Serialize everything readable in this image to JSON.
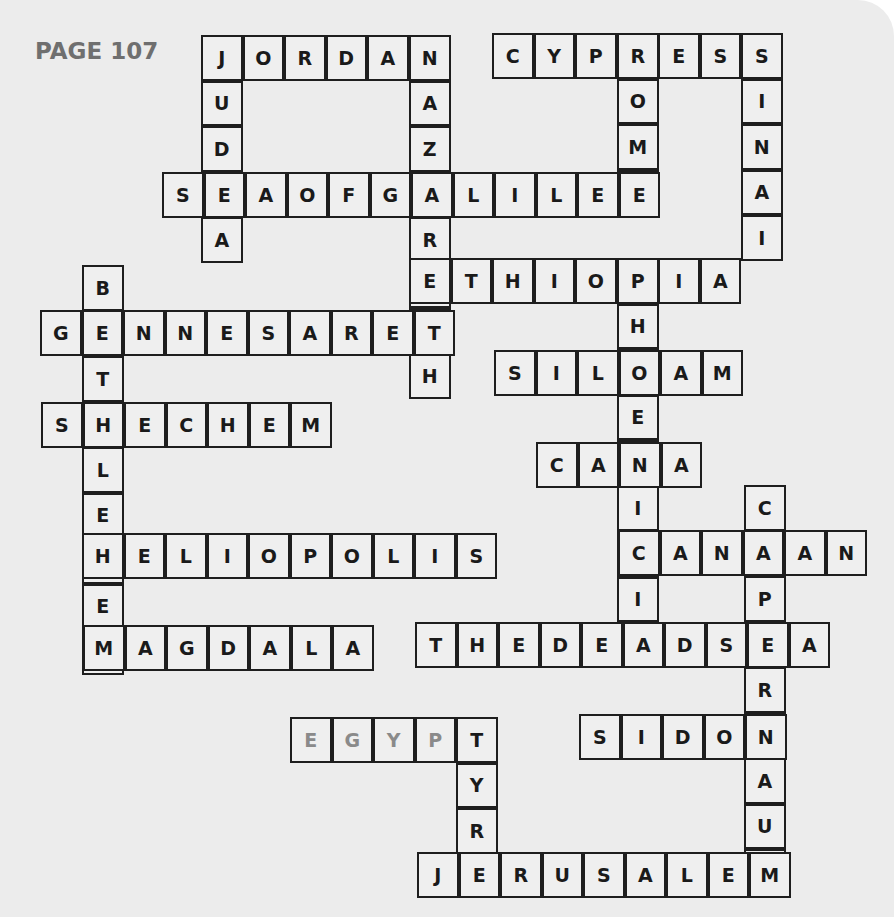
{
  "page": {
    "label": "PAGE 107",
    "colors": {
      "background": "#ececec",
      "cell_fill": "#efefef",
      "cell_border": "#1e1e1e",
      "letter": "#1a1a1a",
      "muted_letter": "#8a8a8a",
      "label": "#6f6f6f"
    }
  },
  "puzzle": {
    "type": "crossword-solution",
    "cell_size": {
      "w": 41.5,
      "h": 45.5
    },
    "words": [
      {
        "word": "JORDAN",
        "dir": "across",
        "x": 201,
        "y": 35
      },
      {
        "word": "JUDEA",
        "dir": "down",
        "x": 201,
        "y": 35
      },
      {
        "word": "NAZARETH",
        "dir": "down",
        "x": 409,
        "y": 35
      },
      {
        "word": "CYPRESS",
        "dir": "across",
        "x": 492,
        "y": 33
      },
      {
        "word": "ROME",
        "dir": "down",
        "x": 617,
        "y": 33
      },
      {
        "word": "SINAI",
        "dir": "down",
        "x": 741,
        "y": 33
      },
      {
        "word": "SEAOFGALILEE",
        "dir": "across",
        "x": 162,
        "y": 172
      },
      {
        "word": "ETHIOPIA",
        "dir": "across",
        "x": 409,
        "y": 258
      },
      {
        "word": "BETHLEHEM",
        "dir": "down",
        "x": 82,
        "y": 265
      },
      {
        "word": "GENNESARET",
        "dir": "across",
        "x": 40,
        "y": 310
      },
      {
        "word": "PHOENICIA",
        "dir": "down",
        "x": 617,
        "y": 258
      },
      {
        "word": "SILOAM",
        "dir": "across",
        "x": 494,
        "y": 350
      },
      {
        "word": "SHECHEM",
        "dir": "across",
        "x": 41,
        "y": 402
      },
      {
        "word": "CANA",
        "dir": "across",
        "x": 536,
        "y": 442
      },
      {
        "word": "CAPERNAUM",
        "dir": "down",
        "x": 744,
        "y": 485
      },
      {
        "word": "HELIOPOLIS",
        "dir": "across",
        "x": 82,
        "y": 533
      },
      {
        "word": "CANAAN",
        "dir": "across",
        "x": 618,
        "y": 530
      },
      {
        "word": "MAGDALA",
        "dir": "across",
        "x": 83,
        "y": 625
      },
      {
        "word": "THEDEADSEA",
        "dir": "across",
        "x": 415,
        "y": 622
      },
      {
        "word": "EGYPT",
        "dir": "across",
        "x": 290,
        "y": 717,
        "muted": true
      },
      {
        "word": "TYR",
        "dir": "down",
        "x": 456,
        "y": 717
      },
      {
        "word": "SIDON",
        "dir": "across",
        "x": 579,
        "y": 714
      },
      {
        "word": "JERUSALEM",
        "dir": "across",
        "x": 417,
        "y": 852
      }
    ]
  }
}
